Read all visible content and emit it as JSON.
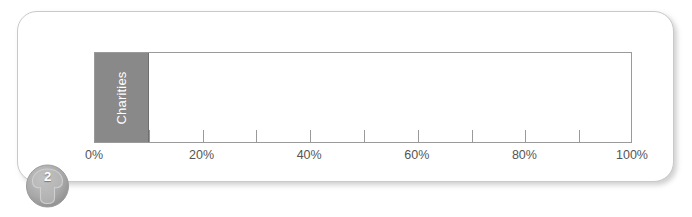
{
  "figure": {
    "badge_number": "2",
    "badge_icon": "mushroom-arrow-icon"
  },
  "chart_data": {
    "type": "bar",
    "orientation": "horizontal",
    "title": "",
    "subtitle": "",
    "xlabel": "",
    "ylabel": "",
    "categories": [
      "Charities"
    ],
    "values": [
      10
    ],
    "series": [
      {
        "name": "Charities",
        "values": [
          10
        ]
      }
    ],
    "xlim": [
      0,
      100
    ],
    "x_tick_values": [
      0,
      10,
      20,
      30,
      40,
      50,
      60,
      70,
      80,
      90,
      100
    ],
    "x_tick_labels": [
      "0%",
      "",
      "20%",
      "",
      "40%",
      "",
      "60%",
      "",
      "80%",
      "",
      "100%"
    ],
    "labeled_ticks": [
      {
        "value": 0,
        "label": "0%"
      },
      {
        "value": 20,
        "label": "20%"
      },
      {
        "value": 40,
        "label": "40%"
      },
      {
        "value": 60,
        "label": "60%"
      },
      {
        "value": 80,
        "label": "80%"
      },
      {
        "value": 100,
        "label": "100%"
      }
    ],
    "grid": false,
    "legend": false,
    "legend_position": "none",
    "bar_color": "#898989",
    "bar_label_color": "#ffffff",
    "axis_color": "#9a9a9a",
    "plot_background": "#ffffff",
    "annotations": []
  }
}
